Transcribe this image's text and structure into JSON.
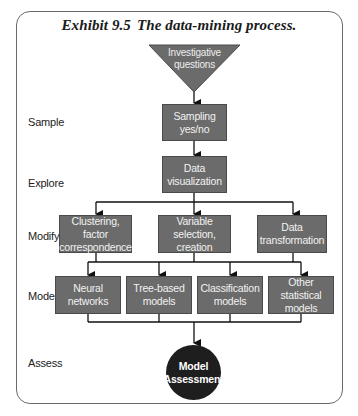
{
  "title": {
    "exhibit": "Exhibit 9.5",
    "caption": "The data-mining process."
  },
  "stages": {
    "sample": "Sample",
    "explore": "Explore",
    "modify": "Modify",
    "model": "Model",
    "assess": "Assess"
  },
  "start": {
    "line1": "Investigative",
    "line2": "questions"
  },
  "sample_step": {
    "line1": "Sampling",
    "line2": "yes/no"
  },
  "explore_step": {
    "line1": "Data",
    "line2": "visualization"
  },
  "modify_steps": [
    {
      "line1": "Clustering, factor",
      "line2": "correspondence"
    },
    {
      "line1": "Variable",
      "line2": "selection, creation"
    },
    {
      "line1": "Data",
      "line2": "transformation"
    }
  ],
  "model_steps": [
    {
      "line1": "Neural",
      "line2": "networks"
    },
    {
      "line1": "Tree-based",
      "line2": "models"
    },
    {
      "line1": "Classification",
      "line2": "models"
    },
    {
      "line1": "Other statistical",
      "line2": "models"
    }
  ],
  "assess_step": {
    "line1": "Model",
    "line2": "Assessment"
  },
  "colors": {
    "box_fill": "#6b6b6b",
    "box_border": "#4a4a4a",
    "circle_fill": "#1e1e1e",
    "line": "#111111",
    "frame": "#6a6a6a"
  }
}
